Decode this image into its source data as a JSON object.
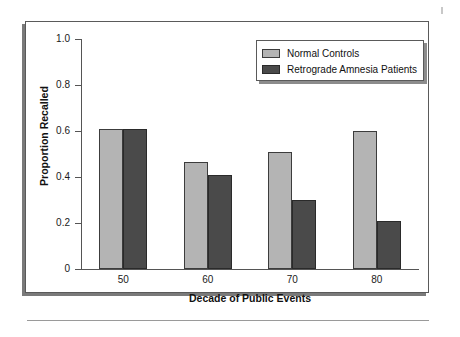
{
  "chart_data": {
    "type": "bar",
    "title": "",
    "xlabel": "Decade of Public Events",
    "ylabel": "Proportion Recalled",
    "categories": [
      "50",
      "60",
      "70",
      "80"
    ],
    "series": [
      {
        "name": "Normal Controls",
        "color": "#b4b4b4",
        "values": [
          0.61,
          0.465,
          0.51,
          0.6
        ]
      },
      {
        "name": "Retrograde Amnesia Patients",
        "color": "#4a4a4a",
        "values": [
          0.61,
          0.41,
          0.3,
          0.21
        ]
      }
    ],
    "ylim": [
      0,
      1.0
    ],
    "ytick_labels": [
      "0",
      "0.2",
      "0.4",
      "0.6",
      "0.8",
      "1.0"
    ],
    "ytick_values": [
      0,
      0.2,
      0.4,
      0.6,
      0.8,
      1.0
    ],
    "grid": false,
    "legend_position": "top-right"
  },
  "figure": {
    "frame_border_color": "#5a5a5a",
    "shadow_color": "#7a7a7a",
    "background": "#ffffff"
  }
}
